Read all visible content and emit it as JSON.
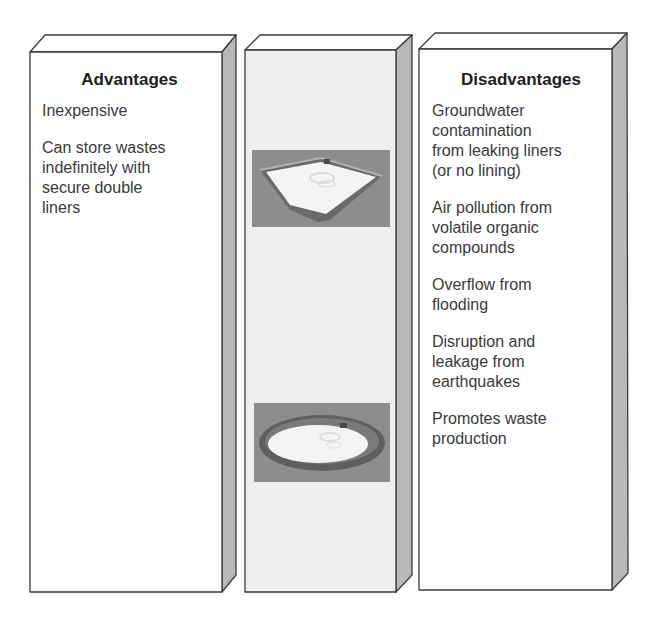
{
  "advantages": {
    "heading": "Advantages",
    "items": [
      "Inexpensive",
      "Can store wastes\nindefinitely with\nsecure double\nliners"
    ]
  },
  "disadvantages": {
    "heading": "Disadvantages",
    "items": [
      "Groundwater\ncontamination\nfrom leaking liners\n(or no lining)",
      "Air pollution from\nvolatile organic\ncompounds",
      "Overflow from\nflooding",
      "Disruption and\nleakage from\nearthquakes",
      "Promotes waste\nproduction"
    ]
  },
  "center": {
    "images": [
      {
        "name": "rectangular-surface-impoundment",
        "shape": "square"
      },
      {
        "name": "circular-surface-impoundment",
        "shape": "round"
      }
    ]
  },
  "colors": {
    "panel_front": "#ffffff",
    "center_front": "#efefef",
    "panel_side": "#b9b9b9",
    "outline": "#3c3c3c",
    "thumb_bg": "#8d8d8d",
    "liquid": "#f4f4f4",
    "berm": "#5f5f5f"
  }
}
